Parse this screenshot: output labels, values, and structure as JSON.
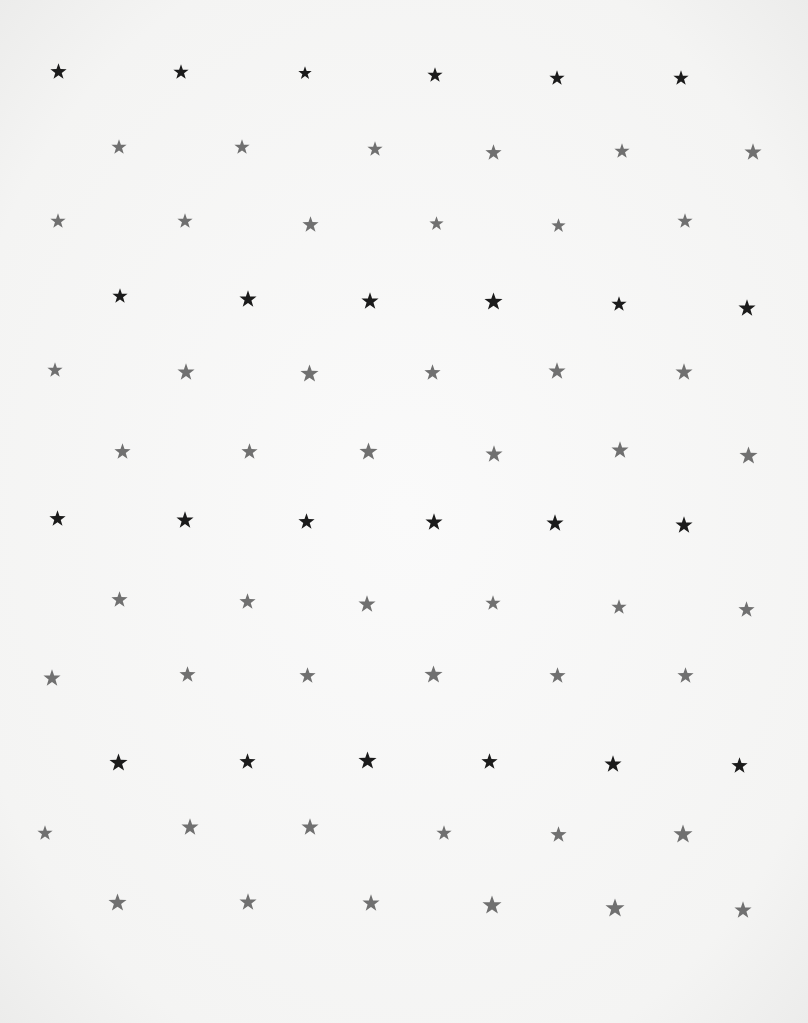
{
  "image": {
    "description": "Star pattern printed on white paper",
    "background": "#f6f6f5",
    "colors": {
      "dark": "#1b1b1b",
      "gray": "#707070"
    }
  },
  "stars": [
    {
      "x": 58,
      "y": 71,
      "c": "dark",
      "s": 17
    },
    {
      "x": 181,
      "y": 72,
      "c": "dark",
      "s": 16
    },
    {
      "x": 305,
      "y": 73,
      "c": "dark",
      "s": 14
    },
    {
      "x": 435,
      "y": 75,
      "c": "dark",
      "s": 16
    },
    {
      "x": 557,
      "y": 78,
      "c": "dark",
      "s": 16
    },
    {
      "x": 681,
      "y": 78,
      "c": "dark",
      "s": 16
    },
    {
      "x": 119,
      "y": 147,
      "c": "gray",
      "s": 16
    },
    {
      "x": 242,
      "y": 147,
      "c": "gray",
      "s": 16
    },
    {
      "x": 375,
      "y": 149,
      "c": "gray",
      "s": 16
    },
    {
      "x": 493,
      "y": 152,
      "c": "gray",
      "s": 17
    },
    {
      "x": 622,
      "y": 151,
      "c": "gray",
      "s": 16
    },
    {
      "x": 753,
      "y": 152,
      "c": "gray",
      "s": 18
    },
    {
      "x": 58,
      "y": 221,
      "c": "gray",
      "s": 16
    },
    {
      "x": 185,
      "y": 221,
      "c": "gray",
      "s": 16
    },
    {
      "x": 310,
      "y": 224,
      "c": "gray",
      "s": 17
    },
    {
      "x": 436,
      "y": 223,
      "c": "gray",
      "s": 15
    },
    {
      "x": 558,
      "y": 225,
      "c": "gray",
      "s": 15
    },
    {
      "x": 685,
      "y": 221,
      "c": "gray",
      "s": 16
    },
    {
      "x": 120,
      "y": 296,
      "c": "dark",
      "s": 16
    },
    {
      "x": 248,
      "y": 299,
      "c": "dark",
      "s": 18
    },
    {
      "x": 370,
      "y": 301,
      "c": "dark",
      "s": 18
    },
    {
      "x": 493,
      "y": 301,
      "c": "dark",
      "s": 19
    },
    {
      "x": 619,
      "y": 304,
      "c": "dark",
      "s": 16
    },
    {
      "x": 747,
      "y": 308,
      "c": "dark",
      "s": 18
    },
    {
      "x": 55,
      "y": 370,
      "c": "gray",
      "s": 16
    },
    {
      "x": 186,
      "y": 372,
      "c": "gray",
      "s": 18
    },
    {
      "x": 309,
      "y": 373,
      "c": "gray",
      "s": 19
    },
    {
      "x": 432,
      "y": 372,
      "c": "gray",
      "s": 17
    },
    {
      "x": 557,
      "y": 371,
      "c": "gray",
      "s": 18
    },
    {
      "x": 684,
      "y": 372,
      "c": "gray",
      "s": 18
    },
    {
      "x": 122,
      "y": 451,
      "c": "gray",
      "s": 17
    },
    {
      "x": 249,
      "y": 451,
      "c": "gray",
      "s": 17
    },
    {
      "x": 368,
      "y": 451,
      "c": "gray",
      "s": 19
    },
    {
      "x": 494,
      "y": 454,
      "c": "gray",
      "s": 18
    },
    {
      "x": 620,
      "y": 450,
      "c": "gray",
      "s": 18
    },
    {
      "x": 748,
      "y": 455,
      "c": "gray",
      "s": 19
    },
    {
      "x": 57,
      "y": 518,
      "c": "dark",
      "s": 17
    },
    {
      "x": 185,
      "y": 520,
      "c": "dark",
      "s": 18
    },
    {
      "x": 306,
      "y": 521,
      "c": "dark",
      "s": 17
    },
    {
      "x": 434,
      "y": 522,
      "c": "dark",
      "s": 18
    },
    {
      "x": 555,
      "y": 523,
      "c": "dark",
      "s": 18
    },
    {
      "x": 684,
      "y": 525,
      "c": "dark",
      "s": 18
    },
    {
      "x": 119,
      "y": 599,
      "c": "gray",
      "s": 17
    },
    {
      "x": 247,
      "y": 601,
      "c": "gray",
      "s": 17
    },
    {
      "x": 367,
      "y": 604,
      "c": "gray",
      "s": 18
    },
    {
      "x": 493,
      "y": 603,
      "c": "gray",
      "s": 16
    },
    {
      "x": 619,
      "y": 607,
      "c": "gray",
      "s": 16
    },
    {
      "x": 746,
      "y": 609,
      "c": "gray",
      "s": 17
    },
    {
      "x": 52,
      "y": 678,
      "c": "gray",
      "s": 18
    },
    {
      "x": 187,
      "y": 674,
      "c": "gray",
      "s": 17
    },
    {
      "x": 307,
      "y": 675,
      "c": "gray",
      "s": 17
    },
    {
      "x": 433,
      "y": 674,
      "c": "gray",
      "s": 19
    },
    {
      "x": 557,
      "y": 675,
      "c": "gray",
      "s": 17
    },
    {
      "x": 685,
      "y": 675,
      "c": "gray",
      "s": 17
    },
    {
      "x": 118,
      "y": 762,
      "c": "dark",
      "s": 19
    },
    {
      "x": 247,
      "y": 761,
      "c": "dark",
      "s": 17
    },
    {
      "x": 367,
      "y": 760,
      "c": "dark",
      "s": 19
    },
    {
      "x": 489,
      "y": 761,
      "c": "dark",
      "s": 17
    },
    {
      "x": 613,
      "y": 764,
      "c": "dark",
      "s": 18
    },
    {
      "x": 739,
      "y": 765,
      "c": "dark",
      "s": 17
    },
    {
      "x": 45,
      "y": 833,
      "c": "gray",
      "s": 16
    },
    {
      "x": 190,
      "y": 827,
      "c": "gray",
      "s": 18
    },
    {
      "x": 310,
      "y": 827,
      "c": "gray",
      "s": 18
    },
    {
      "x": 444,
      "y": 833,
      "c": "gray",
      "s": 16
    },
    {
      "x": 558,
      "y": 834,
      "c": "gray",
      "s": 17
    },
    {
      "x": 683,
      "y": 834,
      "c": "gray",
      "s": 20
    },
    {
      "x": 117,
      "y": 902,
      "c": "gray",
      "s": 19
    },
    {
      "x": 248,
      "y": 902,
      "c": "gray",
      "s": 18
    },
    {
      "x": 371,
      "y": 903,
      "c": "gray",
      "s": 18
    },
    {
      "x": 492,
      "y": 905,
      "c": "gray",
      "s": 20
    },
    {
      "x": 615,
      "y": 908,
      "c": "gray",
      "s": 20
    },
    {
      "x": 743,
      "y": 910,
      "c": "gray",
      "s": 18
    }
  ]
}
